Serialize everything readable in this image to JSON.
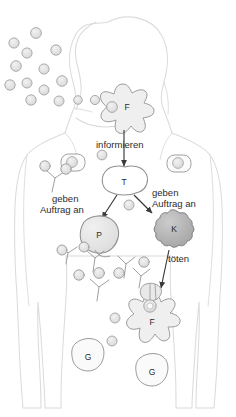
{
  "figure": {
    "language": "de",
    "background_color": "#ffffff"
  },
  "colors": {
    "body_outline": "#d9d9d9",
    "cell_outline": "#9a9a9a",
    "pathogen_fill": "#e2e2e2",
    "pathogen_stroke": "#9e9e9e",
    "plasma_fill": "#e6e6e6",
    "killer_fill": "#b5b5b5",
    "phagocyte_fill": "#efefef",
    "memory_fill": "#f5f5f5",
    "arrow": "#3a3a3a",
    "text": "#2b2b2b"
  },
  "labels": {
    "informieren": "informieren",
    "geben_auftrag_an_left": "geben\nAuftrag an",
    "geben_auftrag_an_left_line1": "geben",
    "geben_auftrag_an_left_line2": "Auftrag an",
    "geben_auftrag_an_right_line1": "geben",
    "geben_auftrag_an_right_line2": "Auftrag an",
    "toeten": "töten"
  },
  "cells": {
    "phagocyte_head": {
      "letter": "F",
      "name": "Fresszelle",
      "x": 123,
      "y": 104
    },
    "t_cell": {
      "letter": "T",
      "name": "T-Zelle",
      "x": 124,
      "y": 182
    },
    "plasma_cell": {
      "letter": "P",
      "name": "Plasmazelle",
      "x": 96,
      "y": 234
    },
    "killer_cell": {
      "letter": "K",
      "name": "Killerzelle",
      "x": 172,
      "y": 228
    },
    "phagocyte_abdomen": {
      "letter": "F",
      "name": "Fresszelle",
      "x": 152,
      "y": 317
    },
    "memory_cell_left": {
      "letter": "G",
      "name": "Gedächtniszelle",
      "x": 88,
      "y": 357
    },
    "memory_cell_right": {
      "letter": "G",
      "name": "Gedächtniszelle",
      "x": 152,
      "y": 372
    }
  },
  "pathogens_outside": [
    {
      "x": 14,
      "y": 43
    },
    {
      "x": 36,
      "y": 33
    },
    {
      "x": 27,
      "y": 53
    },
    {
      "x": 56,
      "y": 50
    },
    {
      "x": 16,
      "y": 66
    },
    {
      "x": 44,
      "y": 69
    },
    {
      "x": 10,
      "y": 85
    },
    {
      "x": 27,
      "y": 83
    },
    {
      "x": 62,
      "y": 81
    },
    {
      "x": 44,
      "y": 90
    },
    {
      "x": 31,
      "y": 100
    },
    {
      "x": 59,
      "y": 101
    },
    {
      "x": 78,
      "y": 99
    },
    {
      "x": 95,
      "y": 100
    },
    {
      "x": 110,
      "y": 101
    }
  ],
  "pathogens_inside": [
    {
      "x": 102,
      "y": 155
    },
    {
      "x": 129,
      "y": 204
    },
    {
      "x": 46,
      "y": 166
    },
    {
      "x": 60,
      "y": 177
    },
    {
      "x": 63,
      "y": 250
    },
    {
      "x": 78,
      "y": 275
    },
    {
      "x": 99,
      "y": 273
    },
    {
      "x": 119,
      "y": 273
    },
    {
      "x": 144,
      "y": 262
    },
    {
      "x": 140,
      "y": 288
    },
    {
      "x": 121,
      "y": 297
    },
    {
      "x": 115,
      "y": 318
    },
    {
      "x": 112,
      "y": 339
    }
  ],
  "lymphocytes": [
    {
      "x": 72,
      "y": 163,
      "name": "lymphocyte-left"
    },
    {
      "x": 178,
      "y": 164,
      "name": "lymphocyte-right"
    }
  ],
  "antibodies": [
    {
      "x": 55,
      "y": 178
    },
    {
      "x": 95,
      "y": 258
    },
    {
      "x": 126,
      "y": 262
    },
    {
      "x": 99,
      "y": 285
    },
    {
      "x": 141,
      "y": 274
    }
  ],
  "arrows": [
    {
      "name": "arrow-phagocyte-to-tcell",
      "from": "F (Kopf)",
      "to": "T",
      "label": "informieren"
    },
    {
      "name": "arrow-tcell-to-plasma",
      "from": "T",
      "to": "P",
      "label": "geben Auftrag an"
    },
    {
      "name": "arrow-tcell-to-killer",
      "from": "T",
      "to": "K",
      "label": "geben Auftrag an"
    },
    {
      "name": "arrow-killer-to-infected",
      "from": "K",
      "to": "F (Bauch)",
      "label": "töten"
    }
  ]
}
